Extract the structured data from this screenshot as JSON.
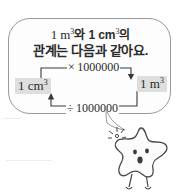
{
  "scene": {
    "title": "1 m3 and 1 cm3 relationship speech bubble with star mascot",
    "background_color": "#ffffff",
    "bubble_border_color": "#9a9a9a",
    "chip_background_color": "#dedede",
    "ink_color": "#2b2b2b"
  },
  "bubble": {
    "headline_line1_pre": "1 m",
    "headline_line1_exp1": "3",
    "headline_line1_mid": "와 1 cm",
    "headline_line1_exp2": "3",
    "headline_line1_post": "의",
    "headline_line2": "관계는 다음과 같아요."
  },
  "diagram": {
    "left_unit_value": "1 cm",
    "left_unit_exponent": "3",
    "right_unit_value": "1 m",
    "right_unit_exponent": "3",
    "multiply_operator": "×",
    "multiply_factor": "1000000",
    "divide_operator": "÷",
    "divide_factor": "1000000",
    "top_arrow_direction": "left-to-right",
    "bottom_arrow_direction": "right-to-left"
  },
  "mascot": {
    "name": "star-character",
    "expression": "surprised",
    "gesture": "finger-snap-sparkle"
  }
}
